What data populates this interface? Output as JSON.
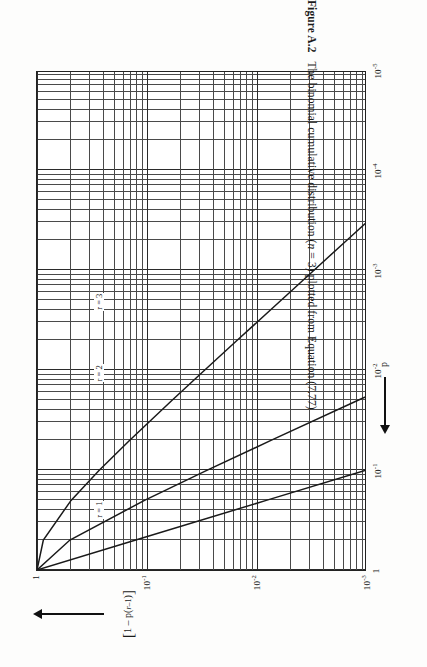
{
  "figure": {
    "caption_number": "Figure A.2",
    "caption_text": "The binomial cumulative distribution (n = 3) plotted from Equation (7.77)",
    "caption_italic_var": "n",
    "y_axis_title": "[1 - p(r-1)]",
    "x_axis_title": "p",
    "y_arrow": "arrow-up-icon",
    "x_arrow": "arrow-left-icon"
  },
  "axes": {
    "x_tick_labels": [
      "1",
      "10-1",
      "10-2",
      "10-3",
      "10-4",
      "10-5"
    ],
    "x_tick_exponents": [
      "",
      "-1",
      "-2",
      "-3",
      "-4",
      "-5"
    ],
    "x_tick_mantissa": [
      "1",
      "10",
      "10",
      "10",
      "10",
      "10"
    ],
    "y_tick_mantissa": [
      "1",
      "10",
      "10",
      "10"
    ],
    "y_tick_exponents": [
      "",
      "-1",
      "-2",
      "-3"
    ],
    "y_tick_labels": [
      "1",
      "10-1",
      "10-2",
      "10-3"
    ],
    "grid": "log-log minor and major gridlines"
  },
  "curve_labels": [
    {
      "id": "r3",
      "text": "r = 3"
    },
    {
      "id": "r2",
      "text": "r = 2"
    },
    {
      "id": "r1",
      "text": "r = 1"
    }
  ],
  "chart_data": {
    "type": "line",
    "title": "The binomial cumulative distribution (n = 3) plotted from Equation (7.77)",
    "xlabel": "p",
    "ylabel": "[1 - p(r-1)]",
    "xscale": "log",
    "yscale": "log",
    "xlim": [
      1e-05,
      1
    ],
    "ylim": [
      0.001,
      1
    ],
    "grid": true,
    "legend": "inline curve labels",
    "x_ticks": [
      1,
      0.1,
      0.01,
      0.001,
      0.0001,
      1e-05
    ],
    "y_ticks": [
      1,
      0.1,
      0.01,
      0.001
    ],
    "note": "n = 3; curves are cumulative binomial tail probabilities 1 - P(r-1) vs p",
    "series": [
      {
        "name": "r = 1",
        "x": [
          1.0,
          0.5,
          0.2,
          0.1,
          0.05,
          0.02,
          0.01,
          0.005,
          0.002,
          0.001,
          0.0005,
          0.0002,
          0.0001,
          5e-05,
          2e-05,
          1e-05
        ],
        "y": [
          1.0,
          0.875,
          0.488,
          0.271,
          0.1426,
          0.0588,
          0.0297,
          0.01493,
          0.005988,
          0.002997,
          0.0014993,
          0.00059988,
          0.00029997,
          0.00014999,
          6e-05,
          3e-05
        ]
      },
      {
        "name": "r = 2",
        "x": [
          1.0,
          0.5,
          0.2,
          0.1,
          0.05,
          0.02,
          0.01,
          0.005,
          0.002,
          0.001,
          0.0005,
          0.0002,
          0.0001,
          5e-05,
          2e-05,
          1e-05
        ],
        "y": [
          1.0,
          0.5,
          0.104,
          0.028,
          0.00725,
          0.001184,
          0.000298,
          7.47e-05,
          1.197e-05,
          2.997e-06,
          7.49e-07,
          1.2e-07,
          3e-08,
          7.5e-09,
          1.2e-09,
          3e-10
        ]
      },
      {
        "name": "r = 3",
        "x": [
          1.0,
          0.5,
          0.2,
          0.1,
          0.05,
          0.02,
          0.01,
          0.005,
          0.002,
          0.001,
          0.0005,
          0.0002,
          0.0001,
          5e-05,
          2e-05,
          1e-05
        ],
        "y": [
          1.0,
          0.125,
          0.008,
          0.001,
          0.000125,
          8e-06,
          1e-06,
          1.25e-07,
          8e-09,
          1e-09,
          1.25e-10,
          8e-12,
          1e-12,
          1.25e-13,
          8e-15,
          1e-15
        ]
      }
    ]
  }
}
